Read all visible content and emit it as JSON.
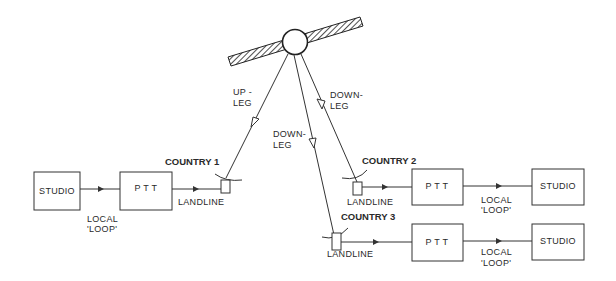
{
  "diagram": {
    "satellite": {
      "label": ""
    },
    "legs": {
      "up_leg": {
        "line1": "UP -",
        "line2": "LEG"
      },
      "down_leg_1": {
        "line1": "DOWN-",
        "line2": "LEG"
      },
      "down_leg_2": {
        "line1": "DOWN-",
        "line2": "LEG"
      }
    },
    "country1": {
      "name": "COUNTRY 1",
      "studio": "STUDIO",
      "ptt": "P T T",
      "local_loop_line1": "LOCAL",
      "local_loop_line2": "'LOOP'",
      "landline": "LANDLINE"
    },
    "country2": {
      "name": "COUNTRY 2",
      "landline": "LANDLINE",
      "ptt": "P T T",
      "local_loop_line1": "LOCAL",
      "local_loop_line2": "'LOOP'",
      "studio": "STUDIO"
    },
    "country3": {
      "name": "COUNTRY 3",
      "landline": "LANDLINE",
      "ptt": "P T T",
      "local_loop_line1": "LOCAL",
      "local_loop_line2": "'LOOP'",
      "studio": "STUDIO"
    }
  }
}
